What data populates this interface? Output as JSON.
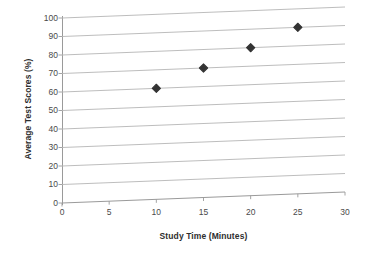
{
  "chart_data": {
    "type": "scatter",
    "title": "",
    "xlabel": "Study Time (Minutes)",
    "ylabel": "Average Test Scores (%)",
    "xlim": [
      0,
      30
    ],
    "ylim": [
      0,
      100
    ],
    "xticks": [
      0,
      5,
      10,
      15,
      20,
      25,
      30
    ],
    "yticks": [
      0,
      10,
      20,
      30,
      40,
      50,
      60,
      70,
      80,
      90,
      100
    ],
    "grid": "horizontal",
    "legend": "none",
    "marker": "diamond",
    "marker_color": "#333333",
    "gridline_color": "#b5b5b5",
    "axis_color": "#9a9a9a",
    "background": "#ffffff",
    "series": [
      {
        "name": "Average Test Scores",
        "points": [
          {
            "x": 10,
            "y": 60
          },
          {
            "x": 15,
            "y": 70
          },
          {
            "x": 20,
            "y": 80
          },
          {
            "x": 25,
            "y": 90
          }
        ]
      }
    ]
  }
}
